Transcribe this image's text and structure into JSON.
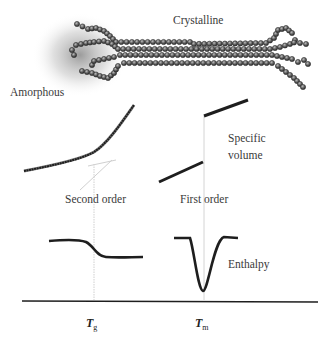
{
  "diagram": {
    "title_labels": {
      "crystalline": "Crystalline",
      "amorphous": "Amorphous"
    },
    "panels": {
      "specific_volume": {
        "label_line1": "Specific",
        "label_line2": "volume"
      },
      "enthalpy": {
        "label": "Enthalpy"
      }
    },
    "transitions": {
      "second_order": "Second order",
      "first_order": "First order"
    },
    "axis": {
      "tg_main": "T",
      "tg_sub": "g",
      "tm_main": "T",
      "tm_sub": "m"
    },
    "colors": {
      "curve": "#1e1e1e",
      "guide": "#c8c8c8",
      "bead": "#555555",
      "halo": "#9a9a9a"
    }
  }
}
